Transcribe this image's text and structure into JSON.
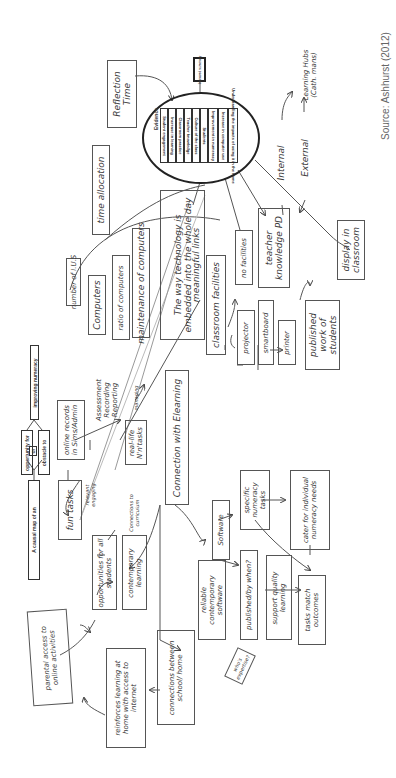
{
  "source": "Source: Ashhurst (2012)",
  "legend": {
    "causal_map": "A causal map of an",
    "opportunity": "opportunity for",
    "or": "or",
    "obstacle": "obstacle to",
    "improving": "improving numeracy"
  },
  "central": {
    "title": "Evidence",
    "items": [
      "Student engagement",
      "Increase in learning",
      "Classroom practice",
      "Teacher knowledge",
      "Culture of the class",
      "Students",
      "Improvement in numeracy",
      "Increase in computer use",
      "Understanding the impacts of using it in the home"
    ],
    "outcome_box": "Improved numeracy"
  },
  "nodes": {
    "reflection_time": "Reflection Time",
    "time_allocation": "time allocation",
    "learning_hubs": "Learning Hubs (Cath. mans)",
    "internal": "Internal",
    "external": "External",
    "teacher_knowledge": "teacher knowledge PD",
    "display_classroom": "display in classroom",
    "no_facilities": "no facilities",
    "classroom_facilities": "classroom facilities",
    "projector": "projector",
    "smartboard": "smartboard",
    "printer": "printer",
    "published_work": "published work of students",
    "embedded": "The way technology is embedded into the whole day",
    "meaningful_links": "meaningful links",
    "maintenance": "maintenance of computers",
    "ratio": "ratio of computers",
    "computers": "Computers",
    "ius": "number of I.U.S",
    "online_records": "online records in Sims/Admin",
    "assessment": "Assessment Recording Reporting",
    "real_life": "real-life N'n'tasks",
    "managing": "managing",
    "connection_elearning": "Connection with Elearning",
    "fun_tasks": "fun tasks",
    "relevant_engaging": "relevant engaging",
    "opportunities": "opportunities for all students",
    "contemporary": "contemporary learning",
    "connections_curriculum": "Connections to curriculum",
    "software": "Software",
    "reliable_software": "reliable contemporary software",
    "specific_tasks": "specific numeracy tasks",
    "cater_needs": "cater for individual numeracy needs",
    "published_when": "published/by when?",
    "support_quality": "support quality learning",
    "tasks_outcomes": "tasks match outcomes",
    "whos_expertise": "who's expertise?",
    "parental_access": "parental access to online activities",
    "reinforces": "reinforces learning at home with access to internet",
    "school_home": "connections between school/ home"
  }
}
